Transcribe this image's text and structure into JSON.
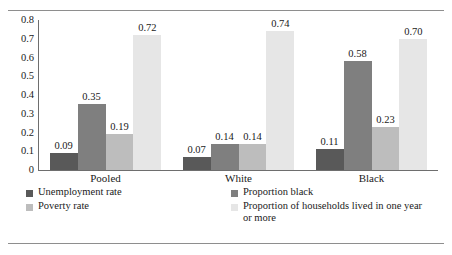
{
  "chart_data": {
    "type": "bar",
    "title": "",
    "xlabel": "",
    "ylabel": "",
    "ylim": [
      0,
      0.8
    ],
    "grid": false,
    "legend_position": "bottom",
    "categories": [
      "Pooled",
      "White",
      "Black"
    ],
    "ytick_labels": [
      "0.8",
      "0.7",
      "0.6",
      "0.5",
      "0.4",
      "0.3",
      "0.2",
      "0.1",
      "0"
    ],
    "ytick_values": [
      0.8,
      0.7,
      0.6,
      0.5,
      0.4,
      0.3,
      0.2,
      0.1,
      0
    ],
    "series": [
      {
        "name": "Unemployment rate",
        "color": "#595959",
        "values": [
          0.09,
          0.07,
          0.11
        ],
        "labels": [
          "0.09",
          "0.07",
          "0.11"
        ]
      },
      {
        "name": "Proportion black",
        "color": "#7f7f7f",
        "values": [
          0.35,
          0.14,
          0.58
        ],
        "labels": [
          "0.35",
          "0.14",
          "0.58"
        ]
      },
      {
        "name": "Poverty rate",
        "color": "#bdbdbd",
        "values": [
          0.19,
          0.14,
          0.23
        ],
        "labels": [
          "0.19",
          "0.14",
          "0.23"
        ]
      },
      {
        "name": "Proportion of households lived in one year or more",
        "color": "#e6e6e6",
        "values": [
          0.72,
          0.74,
          0.7
        ],
        "labels": [
          "0.72",
          "0.74",
          "0.70"
        ]
      }
    ]
  },
  "legend": {
    "items": [
      {
        "label": "Unemployment rate",
        "color": "#595959"
      },
      {
        "label": "Proportion black",
        "color": "#7f7f7f"
      },
      {
        "label": "Poverty rate",
        "color": "#bdbdbd"
      },
      {
        "label": "Proportion of households lived in one year or more",
        "color": "#e6e6e6"
      }
    ]
  }
}
